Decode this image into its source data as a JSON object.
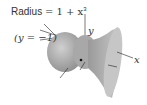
{
  "figure": {
    "title_label": "Radius = 1 + x³",
    "title_word": "Radius",
    "title_formula": "= 1 + x",
    "title_exponent": "3",
    "axis_label_left": "(y = −1)",
    "axis_y": "y",
    "axis_x": "x"
  },
  "colors": {
    "surface": "#b8b8b8",
    "surface_dark": "#8f8f8f",
    "disk": "#c9c9c9",
    "line": "#222222"
  }
}
